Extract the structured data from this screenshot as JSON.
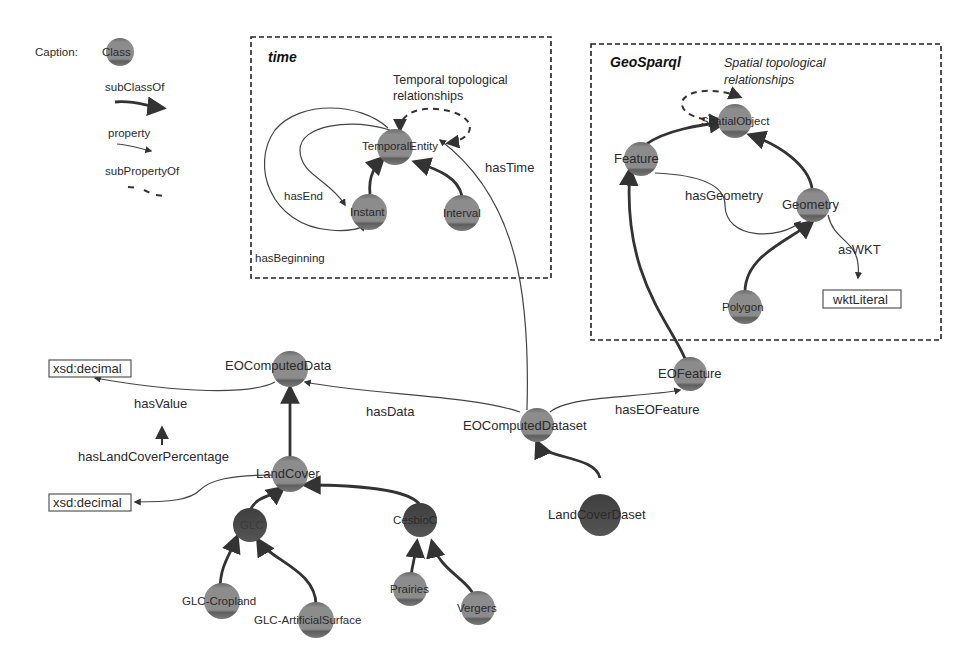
{
  "caption": {
    "title": "Caption:",
    "class_label": "Class",
    "subclass_label": "subClassOf",
    "property_label": "property",
    "subproperty_label": "subPropertyOf"
  },
  "groups": {
    "time": {
      "title": "time",
      "note_line1": "Temporal topological",
      "note_line2": "relationships"
    },
    "geosparql": {
      "title": "GeoSparql",
      "note_line1": "Spatial topological",
      "note_line2": "relationships"
    }
  },
  "nodes": {
    "temporal_entity": "TemporalEntity",
    "instant": "Instant",
    "interval": "Interval",
    "spatial_object": "SpatialObject",
    "feature": "Feature",
    "geometry": "Geometry",
    "polygon": "Polygon",
    "eo_computed_data": "EOComputedData",
    "eo_computed_dataset": "EOComputedDataset",
    "eo_feature": "EOFeature",
    "land_cover": "LandCover",
    "land_cover_dataset": "LandCoverDaset",
    "glc": "GLC",
    "cesbio": "CesbioC",
    "glc_cropland": "GLC-Cropland",
    "glc_artificial": "GLC-ArtificialSurface",
    "prairies": "Prairies",
    "vergers": "Vergers"
  },
  "literals": {
    "wkt_literal": "wktLiteral",
    "xsd_decimal_1": "xsd:decimal",
    "xsd_decimal_2": "xsd:decimal"
  },
  "properties": {
    "has_end": "hasEnd",
    "has_beginning": "hasBeginning",
    "has_time": "hasTime",
    "has_geometry": "hasGeometry",
    "as_wkt": "asWKT",
    "has_value": "hasValue",
    "has_land_cover_percentage": "hasLandCoverPercentage",
    "has_data": "hasData",
    "has_eo_feature": "hasEOFeature"
  },
  "colors": {
    "class_fill": "#8a8a8a",
    "class_band_top": "#6e6e6e",
    "class_band_bottom": "#5a5a5a",
    "dark_class_fill": "#4a4a4a",
    "line": "#333333",
    "box": "#222222"
  }
}
